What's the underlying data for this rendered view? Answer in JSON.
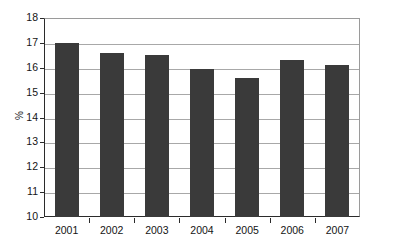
{
  "chart_data": {
    "type": "bar",
    "title": "",
    "subtitle": "",
    "xlabel": "",
    "ylabel": "%",
    "categories": [
      "2001",
      "2002",
      "2003",
      "2004",
      "2005",
      "2006",
      "2007"
    ],
    "values": [
      17.0,
      16.6,
      16.5,
      15.95,
      15.6,
      16.3,
      16.1
    ],
    "ylim": [
      10,
      18
    ],
    "ytick_step": 1,
    "yticks": [
      "18",
      "17",
      "16",
      "15",
      "14",
      "13",
      "12",
      "11",
      "10"
    ],
    "grid": true,
    "grid_axis": "y",
    "legend": false,
    "legend_position": "none",
    "annotations": [],
    "series": [
      {
        "name": "",
        "values": [
          17.0,
          16.6,
          16.5,
          15.95,
          15.6,
          16.3,
          16.1
        ]
      }
    ]
  },
  "style": {
    "bar_color": "#3a3a3a",
    "grid_color": "#a8a8a8",
    "axis_color": "#2b2b2b",
    "frame_color": "#9a9a9a",
    "background": "#ffffff",
    "text_color": "#141414"
  }
}
